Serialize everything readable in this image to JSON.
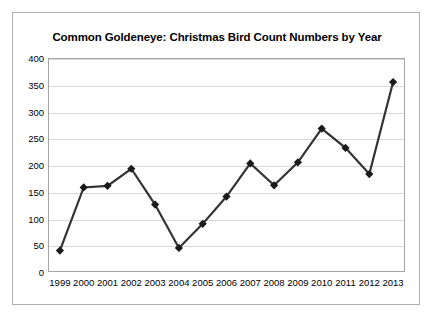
{
  "chart_data": {
    "type": "line",
    "title": "Common Goldeneye: Christmas Bird Count Numbers by Year",
    "xlabel": "",
    "ylabel": "",
    "categories": [
      "1999",
      "2000",
      "2001",
      "2002",
      "2003",
      "2004",
      "2005",
      "2006",
      "2007",
      "2008",
      "2009",
      "2010",
      "2011",
      "2012",
      "2013"
    ],
    "values": [
      40,
      158,
      161,
      193,
      126,
      45,
      90,
      141,
      203,
      162,
      205,
      268,
      232,
      183,
      355
    ],
    "series": [
      {
        "name": "Common Goldeneye count",
        "values": [
          40,
          158,
          161,
          193,
          126,
          45,
          90,
          141,
          203,
          162,
          205,
          268,
          232,
          183,
          355
        ]
      }
    ],
    "ylim": [
      0,
      400
    ],
    "ytick_labels": [
      "0",
      "50",
      "100",
      "150",
      "200",
      "250",
      "300",
      "350",
      "400"
    ],
    "ytick_values": [
      0,
      50,
      100,
      150,
      200,
      250,
      300,
      350,
      400
    ],
    "grid": true,
    "legend": "none",
    "line_color": "#333333",
    "marker": "diamond",
    "marker_color": "#1a1a1a",
    "gridline_color": "#d9d9d9",
    "plot_border_color": "#a6a6a6",
    "figure_border_color": "#b0b0b0",
    "background_color": "#ffffff",
    "text_color": "#000000"
  }
}
